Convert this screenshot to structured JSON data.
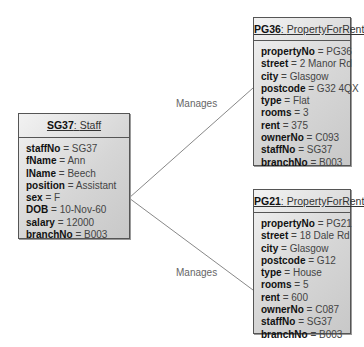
{
  "staff": {
    "title_id": "SG37",
    "title_class": "Staff",
    "attributes": [
      {
        "name": "staffNo",
        "value": "SG37"
      },
      {
        "name": "fName",
        "value": "Ann"
      },
      {
        "name": "lName",
        "value": "Beech"
      },
      {
        "name": "position",
        "value": "Assistant"
      },
      {
        "name": "sex",
        "value": "F"
      },
      {
        "name": "DOB",
        "value": "10-Nov-60"
      },
      {
        "name": "salary",
        "value": "12000"
      },
      {
        "name": "branchNo",
        "value": "B003"
      }
    ]
  },
  "properties": [
    {
      "title_id": "PG36",
      "title_class": "PropertyForRent",
      "attributes": [
        {
          "name": "propertyNo",
          "value": "PG36"
        },
        {
          "name": "street",
          "value": "2 Manor Rd"
        },
        {
          "name": "city",
          "value": "Glasgow"
        },
        {
          "name": "postcode",
          "value": "G32 4QX"
        },
        {
          "name": "type",
          "value": "Flat"
        },
        {
          "name": "rooms",
          "value": "3"
        },
        {
          "name": "rent",
          "value": "375"
        },
        {
          "name": "ownerNo",
          "value": "C093"
        },
        {
          "name": "staffNo",
          "value": "SG37"
        },
        {
          "name": "branchNo",
          "value": "B003"
        }
      ]
    },
    {
      "title_id": "PG21",
      "title_class": "PropertyForRent",
      "attributes": [
        {
          "name": "propertyNo",
          "value": "PG21"
        },
        {
          "name": "street",
          "value": "18 Dale Rd"
        },
        {
          "name": "city",
          "value": "Glasgow"
        },
        {
          "name": "postcode",
          "value": "G12"
        },
        {
          "name": "type",
          "value": "House"
        },
        {
          "name": "rooms",
          "value": "5"
        },
        {
          "name": "rent",
          "value": "600"
        },
        {
          "name": "ownerNo",
          "value": "C087"
        },
        {
          "name": "staffNo",
          "value": "SG37"
        },
        {
          "name": "branchNo",
          "value": "B003"
        }
      ]
    }
  ],
  "links": [
    {
      "label": "Manages"
    },
    {
      "label": "Manages"
    }
  ],
  "separator": " = ",
  "colon": ": "
}
